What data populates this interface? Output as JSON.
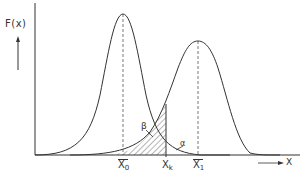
{
  "diagram": {
    "type": "two overlapping normal distributions with decision threshold",
    "y_axis_label": "F(x)",
    "x_axis_label": "X",
    "curves": [
      {
        "name": "left-distribution",
        "mean_label": "X0",
        "peak": "higher, narrower"
      },
      {
        "name": "right-distribution",
        "mean_label": "X1",
        "peak": "lower"
      }
    ],
    "threshold_label": "Xk",
    "regions": {
      "beta": "β",
      "alpha": "α"
    },
    "ticks": {
      "x0": {
        "main": "X",
        "sub": "0"
      },
      "xk": {
        "main": "X",
        "sub": "k"
      },
      "x1": {
        "main": "X",
        "sub": "1"
      }
    },
    "colors": {
      "line": "#333333",
      "background": "#ffffff"
    }
  }
}
